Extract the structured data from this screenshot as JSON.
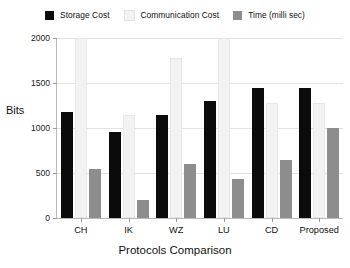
{
  "chart_data": {
    "type": "bar",
    "title": "",
    "xlabel": "Protocols Comparison",
    "ylabel": "Bits",
    "categories": [
      "CH",
      "IK",
      "WZ",
      "LU",
      "CD",
      "Proposed"
    ],
    "series": [
      {
        "name": "Storage Cost",
        "color": "#0b0b0b",
        "values": [
          1180,
          960,
          1150,
          1300,
          1450,
          1450
        ]
      },
      {
        "name": "Communication Cost",
        "color": "#f2f2f2",
        "values": [
          2000,
          1140,
          1780,
          2000,
          1280,
          1280
        ]
      },
      {
        "name": "Time (milli sec)",
        "color": "#8d8d8d",
        "values": [
          540,
          200,
          600,
          430,
          650,
          1000
        ]
      }
    ],
    "ylim": [
      0,
      2000
    ],
    "yticks": [
      0,
      500,
      1000,
      1500,
      2000
    ],
    "ytick_labels": [
      "0",
      "500",
      "1000",
      "1500",
      "2000"
    ],
    "grid": true,
    "legend_position": "top"
  },
  "legend": {
    "entries": [
      {
        "label": "Storage Cost"
      },
      {
        "label": "Communication Cost"
      },
      {
        "label": "Time (milli sec)"
      }
    ]
  },
  "colors": {
    "storage_cost": "#0b0b0b",
    "communication_cost": "#f2f2f2",
    "time": "#8d8d8d",
    "axis": "#b9b9b9",
    "grid": "#e2e2e2",
    "text": "#111111",
    "background": "#ffffff"
  }
}
